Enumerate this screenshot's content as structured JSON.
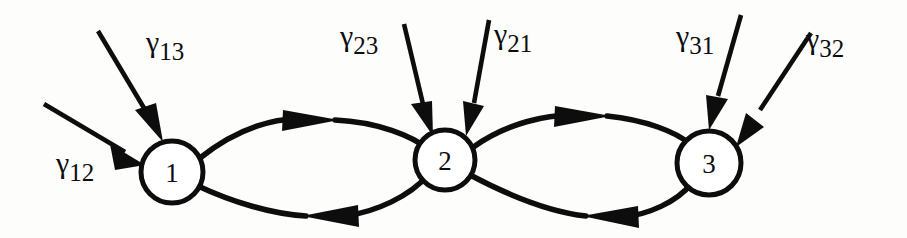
{
  "figure": {
    "type": "state-transition-diagram",
    "background_color": "#fdfdfc",
    "ink_color": "#0d0d0d"
  },
  "nodes": [
    {
      "id": "1",
      "label": "1",
      "cx": 172,
      "cy": 172,
      "r": 31
    },
    {
      "id": "2",
      "label": "2",
      "cx": 445,
      "cy": 160,
      "r": 30
    },
    {
      "id": "3",
      "label": "3",
      "cx": 709,
      "cy": 163,
      "r": 32
    }
  ],
  "edges": [
    {
      "name": "edge-1-to-2-top",
      "from": "1",
      "to": "2",
      "direction": "right",
      "arrow_at_x": 305
    },
    {
      "name": "edge-2-to-1-bottom",
      "from": "2",
      "to": "1",
      "direction": "left",
      "arrow_at_x": 320
    },
    {
      "name": "edge-2-to-3-top",
      "from": "2",
      "to": "3",
      "direction": "right",
      "arrow_at_x": 578
    },
    {
      "name": "edge-3-to-2-bottom",
      "from": "3",
      "to": "2",
      "direction": "left",
      "arrow_at_x": 600
    }
  ],
  "incoming_arrows": [
    {
      "name": "arrow-gamma-12",
      "target_node": "1",
      "label_key": "gamma_12"
    },
    {
      "name": "arrow-gamma-13",
      "target_node": "1",
      "label_key": "gamma_13"
    },
    {
      "name": "arrow-gamma-23",
      "target_node": "2",
      "label_key": "gamma_23"
    },
    {
      "name": "arrow-gamma-21",
      "target_node": "2",
      "label_key": "gamma_21"
    },
    {
      "name": "arrow-gamma-31",
      "target_node": "3",
      "label_key": "gamma_31"
    },
    {
      "name": "arrow-gamma-32",
      "target_node": "3",
      "label_key": "gamma_32"
    }
  ],
  "labels": {
    "gamma_12": {
      "symbol": "γ",
      "subscript": "12",
      "x": 56,
      "y": 148
    },
    "gamma_13": {
      "symbol": "γ",
      "subscript": "13",
      "x": 146,
      "y": 27
    },
    "gamma_23": {
      "symbol": "γ",
      "subscript": "23",
      "x": 340,
      "y": 21
    },
    "gamma_21": {
      "symbol": "γ",
      "subscript": "21",
      "x": 494,
      "y": 19
    },
    "gamma_31": {
      "symbol": "γ",
      "subscript": "31",
      "x": 676,
      "y": 21
    },
    "gamma_32": {
      "symbol": "γ",
      "subscript": "32",
      "x": 806,
      "y": 24
    }
  }
}
